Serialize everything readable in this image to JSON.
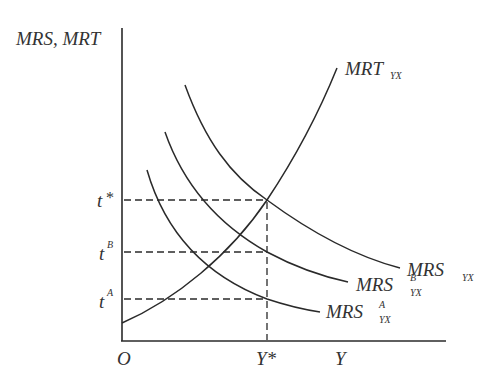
{
  "diagram": {
    "y_axis_label": "MRS, MRT",
    "x_axis_label": "Y",
    "origin_label": "O",
    "x_marker_label": "Y*",
    "y_markers": [
      {
        "base": "t",
        "sup": "*",
        "level": "t_star"
      },
      {
        "base": "t",
        "sup": "B",
        "level": "t_B"
      },
      {
        "base": "t",
        "sup": "A",
        "level": "t_A"
      }
    ],
    "curves": [
      {
        "id": "mrt",
        "base": "MRT",
        "sub": "YX",
        "sup": ""
      },
      {
        "id": "mrs",
        "base": "MRS",
        "sub": "YX",
        "sup": ""
      },
      {
        "id": "mrs_b",
        "base": "MRS",
        "sub": "YX",
        "sup": "B"
      },
      {
        "id": "mrs_a",
        "base": "MRS",
        "sub": "YX",
        "sup": "A"
      }
    ],
    "stroke_color": "#2a2a2a",
    "text_color": "#333333"
  }
}
